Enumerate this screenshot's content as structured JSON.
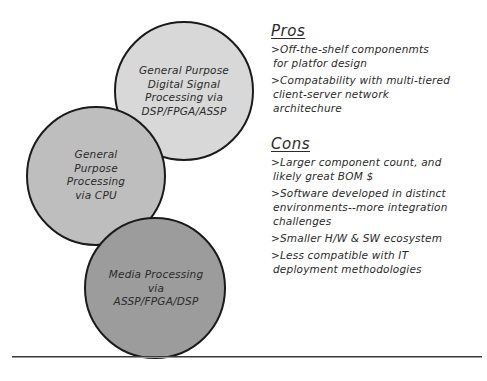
{
  "diagram": {
    "circles": [
      {
        "id": "dsp",
        "label_lines": [
          "General Purpose",
          "Digital Signal",
          "Processing via",
          "DSP/FPGA/ASSP"
        ],
        "fill": "#d8d8d8"
      },
      {
        "id": "cpu",
        "label_lines": [
          "General",
          "Purpose",
          "Processing",
          "via CPU"
        ],
        "fill": "#bebebe"
      },
      {
        "id": "media",
        "label_lines": [
          "Media Processing",
          "via",
          "ASSP/FPGA/DSP"
        ],
        "fill": "#9c9c9c"
      }
    ],
    "stroke_color": "#1a1a1a"
  },
  "pros": {
    "heading": "Pros",
    "items": [
      {
        "lines": [
          ">Off-the-shelf componenmts",
          "for platfor design"
        ]
      },
      {
        "lines": [
          ">Compatability with multi-tiered",
          "client-server network",
          "architechure"
        ]
      }
    ]
  },
  "cons": {
    "heading": "Cons",
    "items": [
      {
        "lines": [
          ">Larger component count, and",
          "likely great BOM $"
        ]
      },
      {
        "lines": [
          ">Software developed in distinct",
          "environments--more integration",
          "challenges"
        ]
      },
      {
        "lines": [
          ">Smaller H/W & SW ecosystem"
        ]
      },
      {
        "lines": [
          ">Less compatible with IT",
          "deployment methodologies"
        ]
      }
    ]
  }
}
